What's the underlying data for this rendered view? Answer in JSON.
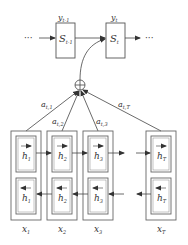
{
  "decoder": {
    "prev_state": {
      "symbol": "S",
      "sub": "t-1",
      "output_symbol": "y",
      "output_sub": "t-1"
    },
    "cur_state": {
      "symbol": "S",
      "sub": "t",
      "output_symbol": "y",
      "output_sub": "t"
    },
    "ellipsis_left": "···",
    "ellipsis_right": "···"
  },
  "attention": {
    "sum_symbol": "⊕",
    "weights": [
      {
        "symbol": "a",
        "sub": "t,1"
      },
      {
        "symbol": "a",
        "sub": "t,2"
      },
      {
        "symbol": "a",
        "sub": "t,3"
      },
      {
        "symbol": "a",
        "sub": "t,T"
      }
    ]
  },
  "encoder": {
    "columns": [
      {
        "fwd": "h",
        "fwd_sub": "1",
        "bwd": "h",
        "bwd_sub": "1",
        "input": "x",
        "input_sub": "1"
      },
      {
        "fwd": "h",
        "fwd_sub": "2",
        "bwd": "h",
        "bwd_sub": "2",
        "input": "x",
        "input_sub": "2"
      },
      {
        "fwd": "h",
        "fwd_sub": "3",
        "bwd": "h",
        "bwd_sub": "3",
        "input": "x",
        "input_sub": "3"
      },
      {
        "fwd": "h",
        "fwd_sub": "T",
        "bwd": "h",
        "bwd_sub": "T",
        "input": "x",
        "input_sub": "T"
      }
    ]
  },
  "colors": {
    "stroke": "#444444",
    "box_stroke": "#666666",
    "background": "#ffffff"
  }
}
